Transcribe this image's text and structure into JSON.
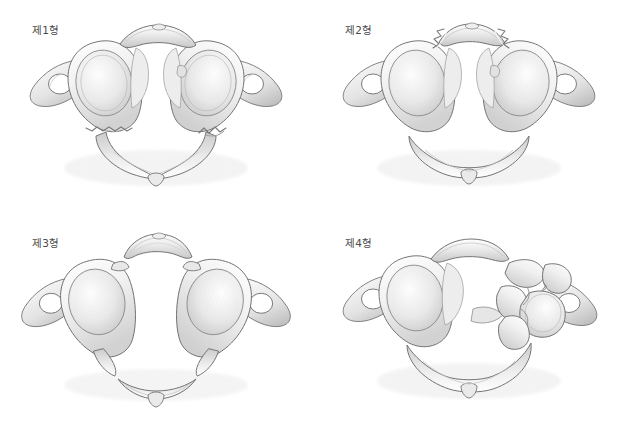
{
  "figure": {
    "background_color": "#ffffff",
    "label_color": "#4a4a4a",
    "view": "superior-axial",
    "layout": "2x2-grid",
    "panel_count": 4
  },
  "palette": {
    "bone_light": "#fbfbfb",
    "bone_mid": "#e9e9e9",
    "bone_shadow": "#c9c9c9",
    "bone_deep_shadow": "#a8a8a8",
    "outline": "#6e6e6e",
    "outline_soft": "#9a9a9a",
    "hatch": "#bdbdbd",
    "cavity": "#ffffff",
    "fracture_edge": "#8c8c8c"
  },
  "panels": [
    {
      "id": "type-1",
      "label": "제1형",
      "fracture_description": "posterior-arch-bilateral",
      "fragment_count": 2,
      "fracture_sites": [
        "left-posterior-arch",
        "right-posterior-arch"
      ]
    },
    {
      "id": "type-2",
      "label": "제2형",
      "fracture_description": "anterior-arch-bilateral",
      "fragment_count": 2,
      "fracture_sites": [
        "left-anterior-arch",
        "right-anterior-arch"
      ]
    },
    {
      "id": "type-3",
      "label": "제3형",
      "fracture_description": "four-part-burst-jefferson",
      "fragment_count": 4,
      "fracture_sites": [
        "anterior-arch-bilateral",
        "posterior-arch-bilateral"
      ]
    },
    {
      "id": "type-4",
      "label": "제4형",
      "fracture_description": "comminuted-lateral-mass",
      "fragment_count": 5,
      "fracture_sites": [
        "right-lateral-mass"
      ]
    }
  ]
}
